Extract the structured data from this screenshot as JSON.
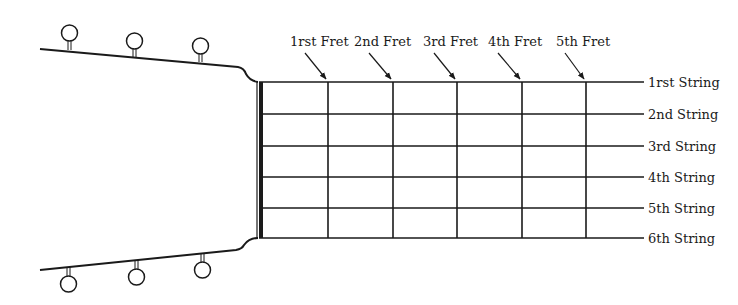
{
  "diagram": {
    "type": "guitar-fretboard",
    "fret_labels": [
      "1rst Fret",
      "2nd Fret",
      "3rd Fret",
      "4th Fret",
      "5th Fret"
    ],
    "string_labels": [
      "1rst String",
      "2nd String",
      "3rd String",
      "4th String",
      "5th String",
      "6th String"
    ],
    "tuning_pegs_top": 3,
    "tuning_pegs_bottom": 3,
    "line_color": "#1a1a1a"
  }
}
